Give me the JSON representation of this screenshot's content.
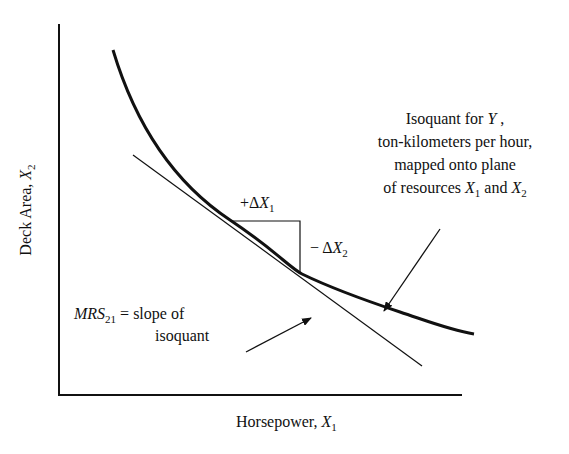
{
  "diagram": {
    "type": "isoquant",
    "x_axis": {
      "label": "Horsepower, ",
      "var": "X",
      "sub": "1"
    },
    "y_axis": {
      "label": "Deck Area, ",
      "var": "X",
      "sub": "2"
    },
    "delta_x1": {
      "sign": "+",
      "delta": "Δ",
      "var": "X",
      "sub": "1"
    },
    "delta_x2": {
      "sign": "− ",
      "delta": "Δ",
      "var": "X",
      "sub": "2"
    },
    "isoquant_note": {
      "line1_pre": "Isoquant for ",
      "line1_var": "Y",
      "line1_post": " ,",
      "line2": "ton-kilometers per hour,",
      "line3": "mapped onto plane",
      "line4_pre": "of resources ",
      "line4_var1": "X",
      "line4_sub1": "1",
      "line4_mid": " and ",
      "line4_var2": "X",
      "line4_sub2": "2"
    },
    "mrs_note": {
      "var": "MRS",
      "sub": "21",
      "line1_post": " = slope of",
      "line2": "isoquant"
    },
    "colors": {
      "ink": "#111111",
      "background": "#ffffff"
    }
  }
}
